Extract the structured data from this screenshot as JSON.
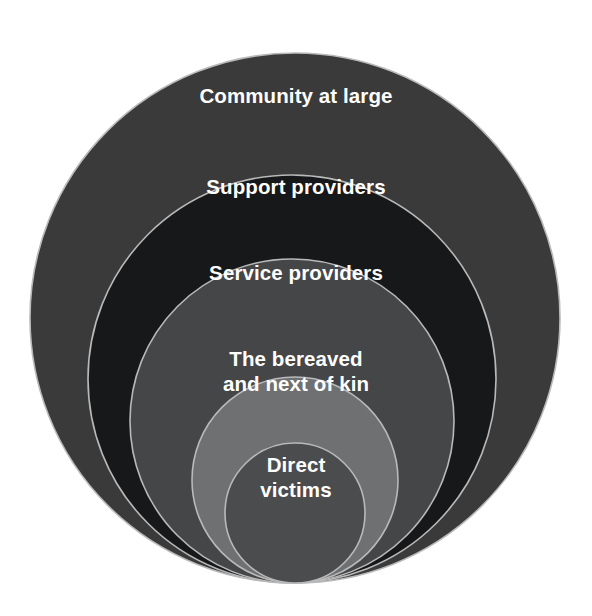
{
  "diagram": {
    "type": "concentric-circles",
    "title": "",
    "background_color": "#ffffff",
    "stroke_color": "#b9b9b9",
    "text_color": "#ffffff",
    "rings": [
      {
        "id": "community-at-large",
        "label": "Community at large",
        "level": 5,
        "fill": "#3a3a3a",
        "cx": 295,
        "cy": 318,
        "r": 265
      },
      {
        "id": "support-providers",
        "label": "Support providers",
        "level": 4,
        "fill": "#16181a",
        "cx": 292,
        "cy": 379,
        "r": 204
      },
      {
        "id": "service-providers",
        "label": "Service providers",
        "level": 3,
        "fill": "#454648",
        "cx": 292,
        "cy": 421,
        "r": 162
      },
      {
        "id": "the-bereaved-and-next-of-kin",
        "label": "The bereaved\nand next of kin",
        "level": 2,
        "fill": "#6f7072",
        "cx": 295,
        "cy": 480,
        "r": 103
      },
      {
        "id": "direct-victims",
        "label": "Direct\nvictims",
        "level": 1,
        "fill": "#4b4c4e",
        "cx": 295,
        "cy": 513,
        "r": 70
      }
    ]
  }
}
